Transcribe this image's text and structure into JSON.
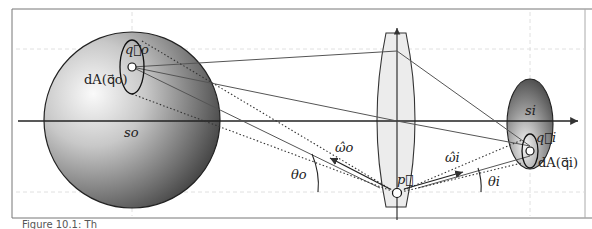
{
  "figure": {
    "caption_fragment": "Figure 10.1: Th",
    "labels": {
      "q_o": "q⃗o",
      "dA_qo": "dA(q⃗o)",
      "s_o": "so",
      "omega_o": "ω̂o",
      "theta_o": "θo",
      "p": "p⃗",
      "omega_i": "ω̂i",
      "theta_i": "θi",
      "s_i": "si",
      "q_i": "q⃗i",
      "dA_qi": "dA(q⃗i)"
    },
    "colors": {
      "line": "#333333",
      "ray": "#555555",
      "lens_fill": "#ececec",
      "sphere_light": "#f4f4f4",
      "sphere_dark": "#3a3a3a",
      "grid": "#d8d8d8"
    }
  }
}
